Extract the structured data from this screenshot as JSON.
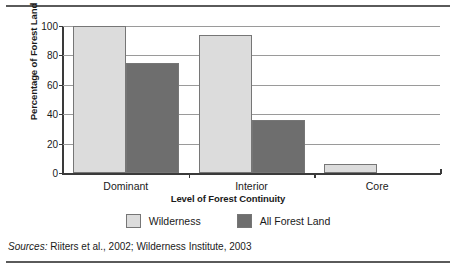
{
  "chart_data": {
    "type": "bar",
    "title": "",
    "xlabel": "Level of Forest Continuity",
    "ylabel": "Percentage of Forest Land",
    "categories": [
      "Dominant",
      "Interior",
      "Core"
    ],
    "ylim": [
      0,
      100
    ],
    "yticks": [
      0,
      20,
      40,
      60,
      80,
      100
    ],
    "ytick_labels": [
      "0",
      "20",
      "40",
      "60",
      "80",
      "100"
    ],
    "grid": true,
    "legend_position": "bottom",
    "series": [
      {
        "name": "Wilderness",
        "color": "#dcdcdc",
        "values": [
          100,
          94,
          6
        ]
      },
      {
        "name": "All Forest Land",
        "color": "#6e6e6e",
        "values": [
          75,
          36,
          0
        ]
      }
    ]
  },
  "legend": {
    "items": [
      {
        "label": "Wilderness",
        "color": "#dcdcdc"
      },
      {
        "label": "All Forest Land",
        "color": "#6e6e6e"
      }
    ]
  },
  "sources": {
    "lead": "Sources:",
    "text": " Riiters et al., 2002; Wilderness Institute, 2003"
  },
  "colors": {
    "wilderness": "#dcdcdc",
    "all_forest_land": "#6e6e6e",
    "axis": "#3a3a3a",
    "grid": "#9a9a9a",
    "rule": "#5a5a5a"
  }
}
